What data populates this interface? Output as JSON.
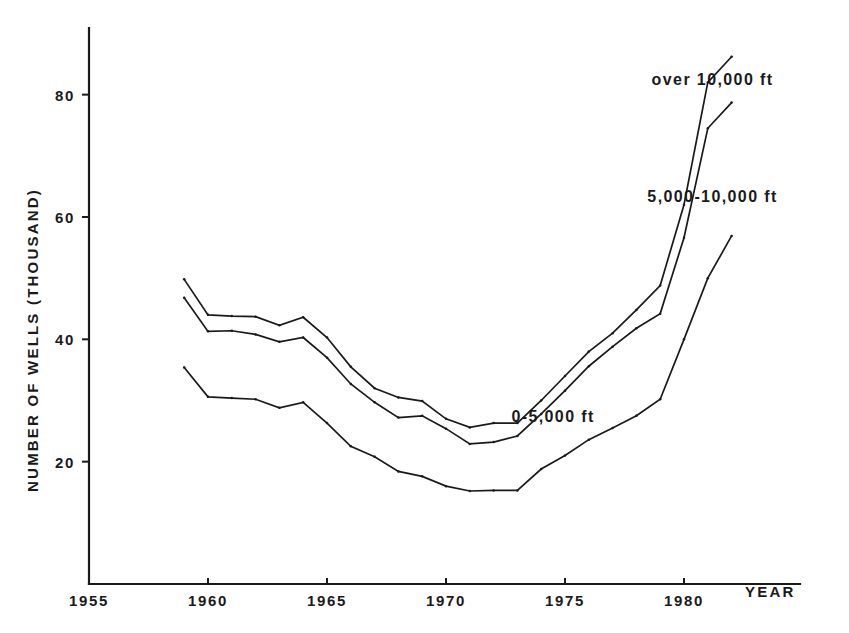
{
  "chart_data": {
    "type": "line",
    "title": "",
    "subtitle": "",
    "xlabel": "YEAR",
    "ylabel": "NUMBER OF WELLS (THOUSAND)",
    "xlim": [
      1955,
      1983
    ],
    "ylim": [
      0,
      90
    ],
    "xticks": [
      1955,
      1960,
      1965,
      1970,
      1975,
      1980
    ],
    "xticklabels": [
      "1955",
      "1960",
      "1965",
      "1970",
      "1975",
      "1980"
    ],
    "yticks": [
      20,
      40,
      60,
      80
    ],
    "yticklabels": [
      "20",
      "40",
      "60",
      "80"
    ],
    "grid": false,
    "legend_position": "inline-right",
    "x": [
      1959,
      1960,
      1961,
      1962,
      1963,
      1964,
      1965,
      1966,
      1967,
      1968,
      1969,
      1970,
      1971,
      1972,
      1973,
      1974,
      1975,
      1976,
      1977,
      1978,
      1979,
      1980,
      1981,
      1982
    ],
    "series": [
      {
        "name": "over 10,000 ft",
        "label": "over 10,000 ft",
        "label_x": 1981.2,
        "label_y": 81.5,
        "values": [
          49.8,
          44.0,
          43.8,
          43.7,
          42.3,
          43.6,
          40.3,
          35.5,
          32.0,
          30.5,
          29.9,
          27.0,
          25.6,
          26.3,
          26.3,
          30.0,
          34.0,
          38.0,
          41.0,
          44.8,
          48.8,
          62.0,
          82.0,
          86.2
        ]
      },
      {
        "name": "5,000-10,000 ft",
        "label": "5,000-10,000 ft",
        "label_x": 1981.2,
        "label_y": 62.5,
        "values": [
          46.8,
          41.3,
          41.4,
          40.8,
          39.6,
          40.3,
          37.0,
          32.7,
          29.7,
          27.2,
          27.5,
          25.4,
          22.9,
          23.2,
          24.2,
          27.8,
          31.6,
          35.6,
          38.8,
          41.8,
          44.2,
          56.6,
          74.5,
          78.7
        ]
      },
      {
        "name": "0-5,000 ft",
        "label": "0-5,000 ft",
        "label_x": 1974.5,
        "label_y": 26.5,
        "values": [
          35.4,
          30.6,
          30.4,
          30.2,
          28.8,
          29.7,
          26.3,
          22.5,
          20.8,
          18.4,
          17.6,
          16.0,
          15.2,
          15.3,
          15.3,
          18.8,
          21.0,
          23.6,
          25.5,
          27.5,
          30.2,
          40.0,
          50.0,
          56.9
        ]
      }
    ]
  }
}
